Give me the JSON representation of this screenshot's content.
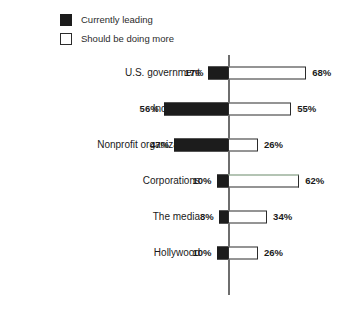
{
  "legend": {
    "items": [
      {
        "label": "Currently leading",
        "swatch": "filled-square-icon",
        "color": "#1c1c1c"
      },
      {
        "label": "Should be doing more",
        "swatch": "outlined-square-icon",
        "color": "#ffffff"
      }
    ]
  },
  "chart_data": {
    "type": "bar",
    "orientation": "horizontal-diverging",
    "title": "",
    "subtitle": "",
    "xlabel": "",
    "ylabel": "",
    "grid": false,
    "legend_position": "top-left",
    "axis_center_value": 0,
    "units": "percent",
    "categories": [
      "U.S. government",
      "Individuals",
      "Nonprofit organizations",
      "Corporations",
      "The media",
      "Hollywood"
    ],
    "series": [
      {
        "name": "Currently leading",
        "direction": "left",
        "color": "#1c1c1c",
        "values": [
          17,
          56,
          47,
          10,
          8,
          10
        ],
        "labels": [
          "17%",
          "56%",
          "47%",
          "10%",
          "8%",
          "10%"
        ]
      },
      {
        "name": "Should be doing more",
        "direction": "right",
        "color": "#ffffff",
        "values": [
          68,
          55,
          26,
          62,
          34,
          26
        ],
        "labels": [
          "68%",
          "55%",
          "26%",
          "62%",
          "34%",
          "26%"
        ]
      }
    ],
    "rows": [
      {
        "category": "U.S. government",
        "left_value": 17,
        "left_label": "17%",
        "right_value": 68,
        "right_label": "68%",
        "right_bar_tinted": false
      },
      {
        "category": "Individuals",
        "left_value": 56,
        "left_label": "56%",
        "right_value": 55,
        "right_label": "55%",
        "right_bar_tinted": false
      },
      {
        "category": "Nonprofit organizations",
        "left_value": 47,
        "left_label": "47%",
        "right_value": 26,
        "right_label": "26%",
        "right_bar_tinted": false
      },
      {
        "category": "Corporations",
        "left_value": 10,
        "left_label": "10%",
        "right_value": 62,
        "right_label": "62%",
        "right_bar_tinted": true
      },
      {
        "category": "The media",
        "left_value": 8,
        "left_label": "8%",
        "right_value": 34,
        "right_label": "34%",
        "right_bar_tinted": false
      },
      {
        "category": "Hollywood",
        "left_value": 10,
        "left_label": "10%",
        "right_value": 26,
        "right_label": "26%",
        "right_bar_tinted": false
      }
    ]
  },
  "style": {
    "axis_color": "#6e6e6e",
    "bar_fill_dark": "#1c1c1c",
    "bar_outline": "#2b2b2b",
    "tint_color": "#6a8a6a",
    "background": "#ffffff",
    "px_per_percent": 1.15,
    "axis_x": 228
  }
}
